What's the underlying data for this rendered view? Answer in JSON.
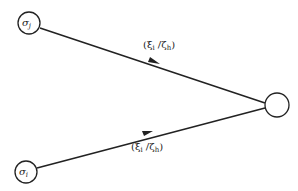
{
  "diagram": {
    "nodes": [
      {
        "id": "sigma_j",
        "label": "σ",
        "subscript": "j",
        "cx": 29,
        "cy": 23,
        "r": 11
      },
      {
        "id": "sigma_i",
        "label": "σ",
        "subscript": "i",
        "cx": 26,
        "cy": 172,
        "r": 11
      },
      {
        "id": "target",
        "label": "",
        "cx": 277,
        "cy": 105,
        "r": 12
      }
    ],
    "edges": [
      {
        "from": "sigma_j",
        "to": "target",
        "label_open": "(ξ",
        "label_sub1": "i",
        "label_mid": " /ζ",
        "label_sub2": "h",
        "label_close": ")"
      },
      {
        "from": "sigma_i",
        "to": "target",
        "label_open": "(ξ",
        "label_sub1": "i",
        "label_mid": " /ζ",
        "label_sub2": "h",
        "label_close": ")"
      }
    ],
    "colors": {
      "stroke": "#222222",
      "background": "#ffffff"
    }
  }
}
